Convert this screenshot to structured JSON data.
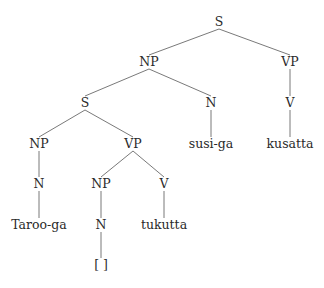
{
  "diagram": {
    "type": "syntax-tree",
    "nodes": [
      {
        "id": "s0",
        "label": "S",
        "x": 219,
        "y": 22
      },
      {
        "id": "np1",
        "label": "NP",
        "x": 149,
        "y": 62
      },
      {
        "id": "vp1",
        "label": "VP",
        "x": 290,
        "y": 62
      },
      {
        "id": "s2",
        "label": "S",
        "x": 85,
        "y": 103
      },
      {
        "id": "n2",
        "label": "N",
        "x": 211,
        "y": 103
      },
      {
        "id": "v2",
        "label": "V",
        "x": 290,
        "y": 103
      },
      {
        "id": "np3",
        "label": "NP",
        "x": 39,
        "y": 144
      },
      {
        "id": "vp3",
        "label": "VP",
        "x": 133,
        "y": 144
      },
      {
        "id": "w_susi",
        "label": "susi-ga",
        "x": 211,
        "y": 144
      },
      {
        "id": "w_kusatta",
        "label": "kusatta",
        "x": 290,
        "y": 144
      },
      {
        "id": "n4",
        "label": "N",
        "x": 39,
        "y": 184
      },
      {
        "id": "np4",
        "label": "NP",
        "x": 101,
        "y": 184
      },
      {
        "id": "v4",
        "label": "V",
        "x": 164,
        "y": 184
      },
      {
        "id": "w_taroo",
        "label": "Taroo-ga",
        "x": 39,
        "y": 225
      },
      {
        "id": "n5",
        "label": "N",
        "x": 101,
        "y": 225
      },
      {
        "id": "w_tukutta",
        "label": "tukutta",
        "x": 164,
        "y": 225
      },
      {
        "id": "gap",
        "label": "[ ]",
        "x": 101,
        "y": 265
      }
    ],
    "edges": [
      [
        "s0",
        "np1"
      ],
      [
        "s0",
        "vp1"
      ],
      [
        "np1",
        "s2"
      ],
      [
        "np1",
        "n2"
      ],
      [
        "vp1",
        "v2"
      ],
      [
        "s2",
        "np3"
      ],
      [
        "s2",
        "vp3"
      ],
      [
        "n2",
        "w_susi"
      ],
      [
        "v2",
        "w_kusatta"
      ],
      [
        "np3",
        "n4"
      ],
      [
        "vp3",
        "np4"
      ],
      [
        "vp3",
        "v4"
      ],
      [
        "n4",
        "w_taroo"
      ],
      [
        "np4",
        "n5"
      ],
      [
        "v4",
        "w_tukutta"
      ],
      [
        "n5",
        "gap"
      ]
    ]
  }
}
